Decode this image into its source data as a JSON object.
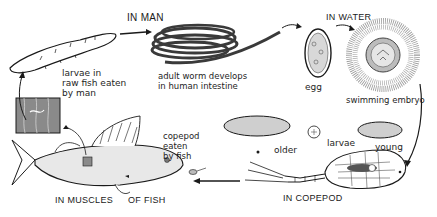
{
  "diagram": {
    "stages": {
      "in_man": "IN MAN",
      "in_water": "IN WATER",
      "in_copepod": "IN COPEPOD",
      "in_muscles": "IN MUSCLES",
      "of_fish": "OF FISH"
    },
    "labels": {
      "larvae_raw_fish": "larvae in\nraw fish eaten\nby man",
      "adult_worm": "adult worm develops\nin human intestine",
      "egg": "egg",
      "swimming_embryo": "swimming embryo",
      "older": "older",
      "larvae": "larvae",
      "young": "young",
      "copepod_eaten": "copepod\neaten\nby fish"
    },
    "colors": {
      "ink": "#1a1a1a",
      "background": "#ffffff",
      "shade": "#8a8a8a"
    }
  }
}
